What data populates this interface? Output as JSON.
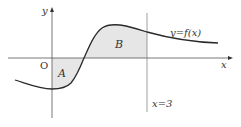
{
  "figure": {
    "axis_x_label": "x",
    "axis_y_label": "y",
    "origin_label": "O",
    "curve_label": "y=f(x)",
    "line_label": "x=3",
    "region_a_label": "A",
    "region_b_label": "B"
  },
  "colors": {
    "curve": "#2a2a2a",
    "axes": "#555555",
    "shade": "#e6e6e6"
  }
}
